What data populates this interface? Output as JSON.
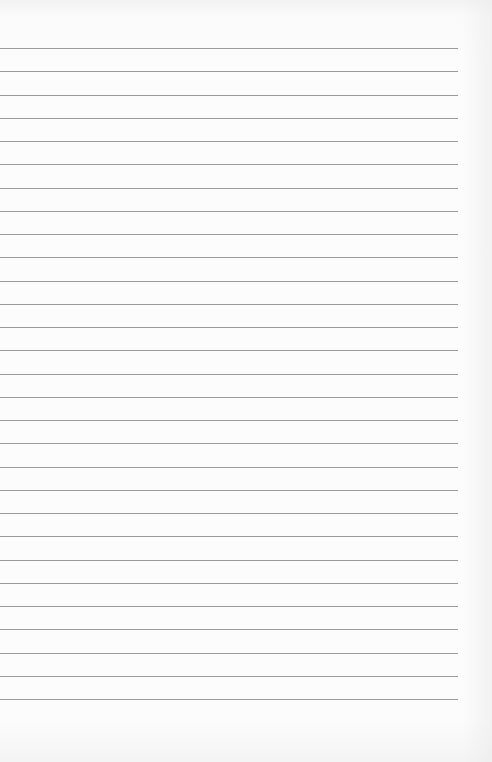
{
  "page": {
    "type": "lined-paper",
    "line_count": 29,
    "first_line_y": 48,
    "line_spacing": 23.25,
    "line_width": 458,
    "line_color": "#9a9a9a",
    "background": "#fcfcfc"
  }
}
